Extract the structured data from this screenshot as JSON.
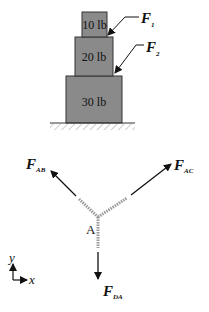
{
  "stack": {
    "boxes": [
      {
        "label": "10 lb"
      },
      {
        "label": "20 lb"
      },
      {
        "label": "30 lb"
      }
    ],
    "forces": [
      {
        "symbol": "F",
        "subscript": "1"
      },
      {
        "symbol": "F",
        "subscript": "2"
      }
    ]
  },
  "free_body": {
    "point": "A",
    "forces": [
      {
        "symbol": "F",
        "subscript": "AB"
      },
      {
        "symbol": "F",
        "subscript": "AC"
      },
      {
        "symbol": "F",
        "subscript": "DA"
      }
    ]
  },
  "axes": {
    "x": "x",
    "y": "y"
  },
  "colors": {
    "box_fill": "#8a8a8a",
    "box_stroke": "#333333",
    "rope": "#9a9a9a"
  }
}
